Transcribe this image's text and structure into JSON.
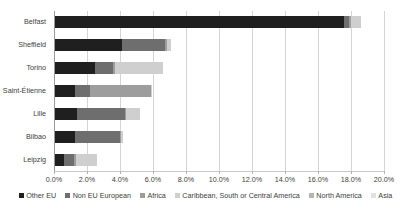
{
  "chart_data": {
    "type": "bar",
    "orientation": "horizontal",
    "stacked": true,
    "title": "",
    "subtitle": "",
    "xlabel": "",
    "ylabel": "",
    "xlim": [
      0,
      20
    ],
    "xtick_labels": [
      "0.0%",
      "2.0%",
      "4.0%",
      "6.0%",
      "8.0%",
      "10.0%",
      "12.0%",
      "14.0%",
      "16.0%",
      "18.0%",
      "20.0%"
    ],
    "xtick_values": [
      0,
      2,
      4,
      6,
      8,
      10,
      12,
      14,
      16,
      18,
      20
    ],
    "grid": true,
    "grid_axis": "x",
    "legend_position": "bottom",
    "categories": [
      "Belfast",
      "Sheffield",
      "Torino",
      "Saint-Étienne",
      "Lille",
      "Bilbao",
      "Leipzig"
    ],
    "series": [
      {
        "name": "Other EU",
        "color": "#1f1f1f",
        "values": [
          17.6,
          4.1,
          2.5,
          1.3,
          1.4,
          1.3,
          0.6
        ]
      },
      {
        "name": "Non EU European",
        "color": "#6e6e6e",
        "values": [
          0.3,
          2.6,
          1.1,
          0.9,
          2.9,
          2.7,
          0.6
        ]
      },
      {
        "name": "Africa",
        "color": "#9d9d9d",
        "values": [
          0.1,
          0.15,
          0.1,
          3.7,
          0.05,
          0.05,
          0.15
        ]
      },
      {
        "name": "Caribbean, South or Central America",
        "color": "#cfcfcf",
        "values": [
          0.6,
          0.25,
          2.9,
          0.05,
          0.85,
          0.15,
          1.25
        ]
      },
      {
        "name": "North America",
        "color": "#b5b5b5",
        "values": [
          0.0,
          0.0,
          0.0,
          0.0,
          0.0,
          0.0,
          0.0
        ]
      },
      {
        "name": "Asia",
        "color": "#e2e2e2",
        "values": [
          0.0,
          0.0,
          0.0,
          0.0,
          0.0,
          0.0,
          0.0
        ]
      }
    ],
    "totals": [
      18.6,
      7.1,
      6.6,
      5.95,
      5.2,
      4.2,
      2.6
    ]
  },
  "colors": {
    "gridline": "#d4d4d4",
    "axis": "#9a9a9a",
    "text": "#3f3f3f",
    "background": "#ffffff"
  }
}
